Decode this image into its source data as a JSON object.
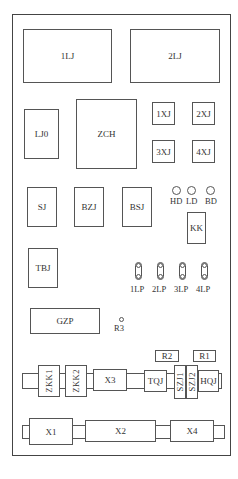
{
  "diagram": {
    "type": "panel-component-layout",
    "components": {
      "1LJ": "1LJ",
      "2LJ": "2LJ",
      "LJ0": "LJ0",
      "ZCH": "ZCH",
      "1XJ": "1XJ",
      "2XJ": "2XJ",
      "3XJ": "3XJ",
      "4XJ": "4XJ",
      "SJ": "SJ",
      "BZJ": "BZJ",
      "BSJ": "BSJ",
      "KK": "KK",
      "TBJ": "TBJ",
      "GZP": "GZP",
      "R1": "R1",
      "R2": "R2",
      "R3": "R3",
      "ZKK1": "ZKK1",
      "ZKK2": "ZKK2",
      "X3": "X3",
      "TQJ": "TQJ",
      "SZJ1": "SZJ1",
      "SZJ2": "SZJ2",
      "HQJ": "HQJ",
      "X1": "X1",
      "X2": "X2",
      "X4": "X4"
    },
    "lamps": [
      "HD",
      "LD",
      "BD"
    ],
    "link_plates": [
      "1LP",
      "2LP",
      "3LP",
      "4LP"
    ]
  }
}
